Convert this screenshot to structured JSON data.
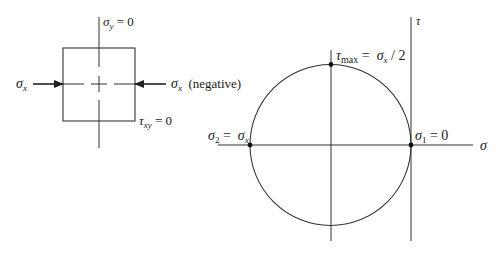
{
  "diagram": {
    "type": "mohr-circle-uniaxial-compression",
    "colors": {
      "line": "#333333",
      "text": "#1a1a1a",
      "background": "#ffffff"
    },
    "element": {
      "top_label": {
        "symbol": "σ",
        "sub": "y",
        "rest": " = 0"
      },
      "left_label": {
        "symbol": "σ",
        "sub": "x"
      },
      "right_label": {
        "symbol": "σ",
        "sub": "x",
        "rest": "  (negative)"
      },
      "shear_label": {
        "symbol": "τ",
        "sub": "xy",
        "rest": " = 0"
      }
    },
    "mohr_circle": {
      "tau_axis_label": "τ",
      "sigma_axis_label": "σ",
      "top_point_label": {
        "symbol": "τ",
        "sub": "max",
        "rest": " =  ",
        "symbol2": "σ",
        "sub2": "x",
        "rest2": " / 2"
      },
      "left_point_label": {
        "symbol": "σ",
        "sub": "2",
        "rest": " =  ",
        "symbol2": "σ",
        "sub2": "x"
      },
      "right_point_label": {
        "symbol": "σ",
        "sub": "1",
        "rest": " = 0"
      }
    }
  }
}
